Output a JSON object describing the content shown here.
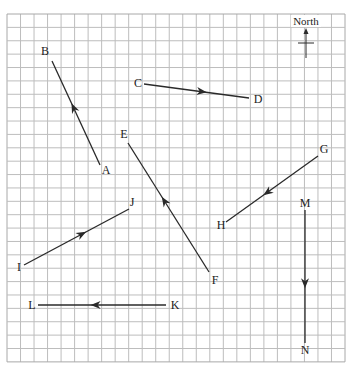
{
  "grid": {
    "x0": 7,
    "y0": 14,
    "cols": 25,
    "rows": 26,
    "cell_w": 13.52,
    "cell_h": 13.38,
    "line_color": "#bdbdbd",
    "border_color": "#a8a8a8"
  },
  "compass": {
    "label": "North",
    "label_pos": [
      306,
      25
    ],
    "arrow_from": [
      306,
      58
    ],
    "arrow_to": [
      306,
      28
    ],
    "tick_from": [
      298,
      43
    ],
    "tick_to": [
      314,
      43
    ]
  },
  "vectors": [
    {
      "id": "AB",
      "from_label": "A",
      "to_label": "B",
      "from": [
        100,
        165
      ],
      "to": [
        52,
        61
      ],
      "from_label_pos": [
        106,
        174
      ],
      "to_label_pos": [
        45,
        55
      ]
    },
    {
      "id": "CD",
      "from_label": "C",
      "to_label": "D",
      "from": [
        144,
        84
      ],
      "to": [
        249,
        98
      ],
      "from_label_pos": [
        138,
        87
      ],
      "to_label_pos": [
        258,
        103
      ]
    },
    {
      "id": "FE",
      "from_label": "F",
      "to_label": "E",
      "from": [
        209,
        272
      ],
      "to": [
        128,
        143
      ],
      "from_label_pos": [
        215,
        284
      ],
      "to_label_pos": [
        124,
        138
      ]
    },
    {
      "id": "GH",
      "from_label": "G",
      "to_label": "H",
      "from": [
        318,
        156
      ],
      "to": [
        226,
        222
      ],
      "from_label_pos": [
        324,
        153
      ],
      "to_label_pos": [
        221,
        229
      ]
    },
    {
      "id": "IJ",
      "from_label": "I",
      "to_label": "J",
      "from": [
        24,
        265
      ],
      "to": [
        129,
        209
      ],
      "from_label_pos": [
        19,
        271
      ],
      "to_label_pos": [
        132,
        206
      ]
    },
    {
      "id": "KL",
      "from_label": "K",
      "to_label": "L",
      "from": [
        166,
        305
      ],
      "to": [
        38,
        305
      ],
      "from_label_pos": [
        175,
        309
      ],
      "to_label_pos": [
        32,
        309
      ]
    },
    {
      "id": "MN",
      "from_label": "M",
      "to_label": "N",
      "from": [
        305,
        210
      ],
      "to": [
        305,
        343
      ],
      "from_label_pos": [
        305,
        207
      ],
      "to_label_pos": [
        305,
        354
      ]
    }
  ],
  "line_color": "#2a2a2a",
  "labels": {
    "A": "A",
    "B": "B",
    "C": "C",
    "D": "D",
    "E": "E",
    "F": "F",
    "G": "G",
    "H": "H",
    "I": "I",
    "J": "J",
    "K": "K",
    "L": "L",
    "M": "M",
    "N": "N"
  }
}
